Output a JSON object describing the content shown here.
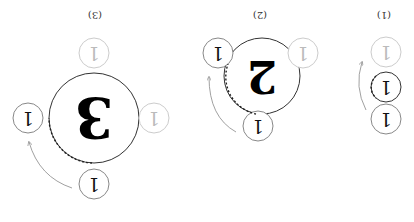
{
  "orientation": "rotated 180 degrees",
  "colors": {
    "active_stroke": "#555555",
    "faded_stroke": "#cccccc",
    "faded_text": "#bbbbbb",
    "text": "#111111",
    "arrow": "#888888",
    "dashed": "#222222"
  },
  "panels": [
    {
      "label": "(1)",
      "center_number": "1",
      "small_circles": [
        {
          "position": "top",
          "value": "1",
          "faded": true
        },
        {
          "position": "center",
          "value": "1",
          "faded": false
        },
        {
          "position": "bottom",
          "value": "1",
          "faded": false
        }
      ]
    },
    {
      "label": "(2)",
      "center_number": "2",
      "small_circles": [
        {
          "position": "upper-left",
          "value": "1",
          "faded": false
        },
        {
          "position": "upper-right",
          "value": "1",
          "faded": true
        },
        {
          "position": "bottom",
          "value": "1",
          "faded": false
        }
      ]
    },
    {
      "label": "(3)",
      "center_number": "3",
      "small_circles": [
        {
          "position": "top",
          "value": "1",
          "faded": true
        },
        {
          "position": "left",
          "value": "1",
          "faded": false
        },
        {
          "position": "right",
          "value": "1",
          "faded": true
        },
        {
          "position": "bottom",
          "value": "1",
          "faded": false
        }
      ]
    }
  ]
}
